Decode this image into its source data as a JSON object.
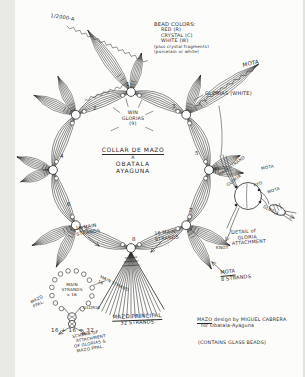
{
  "colors": {
    "ink": "#2b2b2b",
    "paper": "#fcfcfa"
  },
  "corner_note": "1/2000-A",
  "legend": {
    "title": "BEAD COLORS:",
    "items": [
      "RED (R)",
      "CRYSTAL (C)",
      "WHITE (W)",
      "(plus crystal fragments)",
      "(porcelain or white)"
    ]
  },
  "center": {
    "sun_note": {
      "l1": "WIN",
      "l2": "GLORIAS",
      "l3": "(9)"
    },
    "title": {
      "l1": "COLLAR DE MAZO",
      "l2": "A",
      "l3": "OBATALA",
      "l4": "AYAGUNA"
    }
  },
  "ring_numbers": {
    "n1": "1",
    "n2": "2",
    "n3": "3",
    "n4": "4",
    "n5": "5",
    "n6": "6",
    "n7": "7",
    "n8": "8"
  },
  "labels": {
    "mota_top": "MOTA",
    "glorias_white": "GLORIAS (WHITE)",
    "main_strands_left": {
      "l1": "16 MAIN",
      "l2": "STRANDS"
    },
    "main_strands_right": {
      "l1": "16 MAIN",
      "l2": "STRANDS"
    },
    "mota_8": {
      "l1": "MOTA",
      "l2": "8 STRANDS"
    },
    "mazo_principal": {
      "l1": "MAZO PRINCIPAL",
      "l2": "32 STRANDS"
    }
  },
  "detail_right": {
    "main_strand": "MAIN STRAND",
    "gloria_in": "GLORIA",
    "red": "RED",
    "mota_a": "MOTA",
    "mota_b": "MOTA",
    "gloria_out": "GLORIA",
    "knot": "KNOT",
    "caption": {
      "l1": "DETAIL of",
      "l2": "GLORIA",
      "l3": "ATTACHMENT"
    }
  },
  "detail_left": {
    "center": {
      "l1": "MAIN",
      "l2": "STRANDS",
      "l3": "x 16"
    },
    "mazo": {
      "l1": "MAZO",
      "l2": "PPAL."
    },
    "main_strand_16": {
      "l1": "MAIN STRAND",
      "l2": "16"
    },
    "gloria": "GLORIA",
    "equation": "16 + 16 = 32",
    "scheme": {
      "l1": "SCHEME OF",
      "l2": "ATTACHMENT",
      "l3": "OF GLORIAS &",
      "l4": "MAZO PPAL."
    }
  },
  "credits": {
    "word": "MAZO",
    "rest": " design by MIGUEL CABRERA",
    "line2": "for Obatala-Ayaguna",
    "line3": "(CONTAINS GLASS BEADS)"
  }
}
